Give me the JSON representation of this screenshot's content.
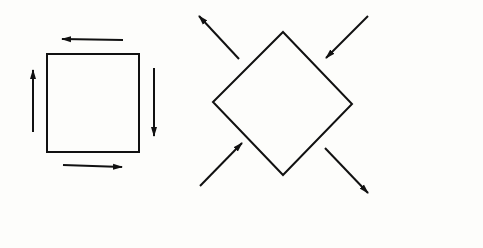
{
  "diagram": {
    "background": "#fdfdfb",
    "stroke": "#111111",
    "figures": [
      {
        "name": "pure-shear-square",
        "description": "Square with tangential arrows showing shear (counter-clockwise on top/left, clockwise pairs)",
        "shape": "square",
        "arrows": [
          "top-pointing-left",
          "left-pointing-up",
          "right-pointing-down",
          "bottom-pointing-right"
        ]
      },
      {
        "name": "rotated-square-principal-stresses",
        "description": "Square rotated 45 degrees with diagonal arrows: compression along one diagonal, tension along the other",
        "shape": "diamond",
        "arrows": [
          "top-left-outward",
          "top-right-inward",
          "bottom-left-inward",
          "bottom-right-outward"
        ]
      }
    ]
  }
}
